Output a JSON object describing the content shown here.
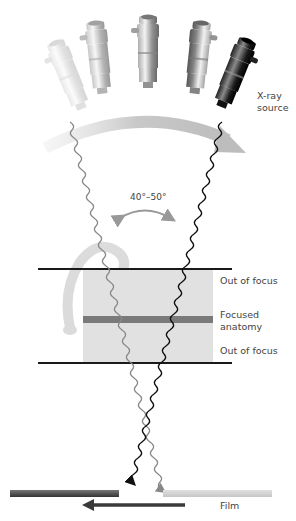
{
  "diagram": {
    "labels": {
      "xray_source": "X-ray\nsource",
      "angle": "40°–50°",
      "out_of_focus_top": "Out of focus",
      "focused_anatomy": "Focused\nanatomy",
      "out_of_focus_bottom": "Out of focus",
      "film": "Film"
    },
    "tubes": [
      {
        "position": 1,
        "shade": "faintest",
        "opacity": 0.25
      },
      {
        "position": 2,
        "shade": "light",
        "opacity": 0.5
      },
      {
        "position": 3,
        "shade": "medium",
        "opacity": 0.7
      },
      {
        "position": 4,
        "shade": "dark",
        "opacity": 0.85
      },
      {
        "position": 5,
        "shade": "darkest",
        "opacity": 1.0
      }
    ],
    "colors": {
      "motion_arrow": "#c8c8c8",
      "plane_line": "#1a1a1a",
      "anatomy_box": "#e1e1e1",
      "focus_band": "#7a7a7a",
      "ray_dark": "#111111",
      "ray_light": "#888888",
      "film_dark": "#555555",
      "film_light": "#d3d3d3",
      "film_arrow": "#3a3a3a"
    }
  }
}
